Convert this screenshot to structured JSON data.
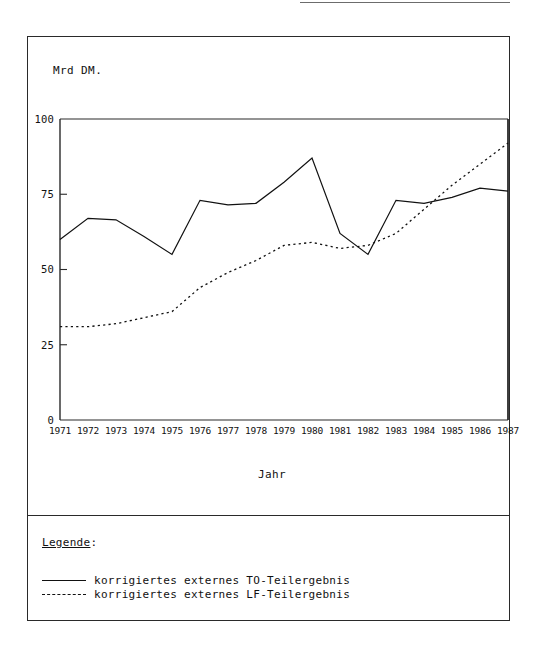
{
  "figure": {
    "y_axis_title": "Mrd DM.",
    "x_axis_title": "Jahr"
  },
  "legend": {
    "heading": "Legende",
    "heading_colon": ":",
    "entries": [
      {
        "style": "solid",
        "label": "korrigiertes externes TO-Teilergebnis"
      },
      {
        "style": "dashed",
        "label": "korrigiertes externes LF-Teilergebnis"
      }
    ]
  },
  "chart_data": {
    "type": "line",
    "title": "",
    "xlabel": "Jahr",
    "ylabel": "Mrd DM.",
    "xlim": [
      1971,
      1987
    ],
    "ylim": [
      0,
      100
    ],
    "ytick_labels": [
      "100",
      "75",
      "50",
      "25",
      "0"
    ],
    "yticks": [
      100,
      75,
      50,
      25,
      0
    ],
    "grid": false,
    "legend_position": "below-plot",
    "categories": [
      1971,
      1972,
      1973,
      1974,
      1975,
      1976,
      1977,
      1978,
      1979,
      1980,
      1981,
      1982,
      1983,
      1984,
      1985,
      1986,
      1987
    ],
    "xtick_labels": [
      "1971",
      "1972",
      "1973",
      "1974",
      "1975",
      "1976",
      "1977",
      "1978",
      "1979",
      "1980",
      "1981",
      "1982",
      "1983",
      "1984",
      "1985",
      "1986",
      "1987"
    ],
    "series": [
      {
        "name": "korrigiertes externes TO-Teilergebnis",
        "style": "solid",
        "color": "#111111",
        "values": [
          60,
          67,
          66.5,
          61,
          55,
          73,
          71.5,
          72,
          79,
          87,
          62,
          55,
          73,
          72,
          74,
          77,
          76
        ]
      },
      {
        "name": "korrigiertes externes LF-Teilergebnis",
        "style": "dashed",
        "color": "#111111",
        "values": [
          31,
          31,
          32,
          34,
          36,
          44,
          49,
          53,
          58,
          59,
          57,
          58,
          62,
          70,
          78,
          85,
          92
        ]
      }
    ]
  }
}
